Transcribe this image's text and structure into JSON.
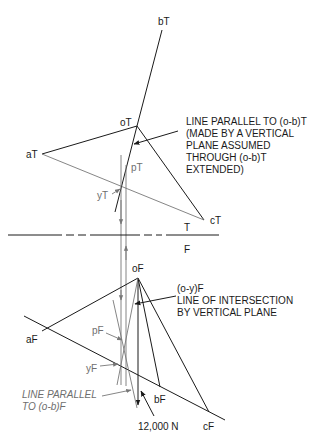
{
  "labels": {
    "bT": "bT",
    "oT": "oT",
    "aT": "aT",
    "cT": "cT",
    "pT": "pT",
    "yT": "yT",
    "T": "T",
    "F": "F",
    "oF": "oF",
    "aF": "aF",
    "bF": "bF",
    "cF": "cF",
    "pF": "pF",
    "yF": "yF",
    "force": "12,000 N"
  },
  "notes": {
    "top_note": [
      "LINE PARALLEL TO (o-b)T",
      "(MADE BY A VERTICAL",
      "PLANE ASSUMED",
      "THROUGH (o-b)T",
      "EXTENDED)"
    ],
    "front_note": [
      "(o-y)F",
      "LINE OF INTERSECTION",
      "BY VERTICAL PLANE"
    ],
    "parallel_note": [
      "LINE PARALLEL",
      "TO (o-b)F"
    ]
  },
  "colors": {
    "line_dark": "#1a1a1a",
    "line_gray": "#777777",
    "background": "#ffffff"
  }
}
